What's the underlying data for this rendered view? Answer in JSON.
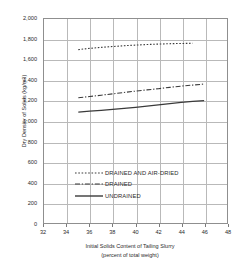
{
  "chart_data": {
    "type": "line",
    "title": "",
    "xlabel": "Initial Solids Content of Tailing Slurry",
    "xlabel_sub": "(percent of total weight)",
    "ylabel": "Dry Density of Solids (kg/m3)",
    "xlim": [
      32,
      48
    ],
    "ylim": [
      0,
      2000
    ],
    "xticks": [
      "32",
      "34",
      "36",
      "38",
      "40",
      "42",
      "44",
      "46",
      "48"
    ],
    "xtick_values": [
      32,
      34,
      36,
      38,
      40,
      42,
      44,
      46,
      48
    ],
    "yticks": [
      "0",
      "200",
      "400",
      "600",
      "800",
      "1,000",
      "1,200",
      "1,400",
      "1,600",
      "1,800",
      "2,000"
    ],
    "ytick_values": [
      0,
      200,
      400,
      600,
      800,
      1000,
      1200,
      1400,
      1600,
      1800,
      2000
    ],
    "grid": true,
    "legend_position": "center-lower",
    "series": [
      {
        "name": "DRAINED AND AIR-DRIED",
        "style": "dotted",
        "x": [
          35.0,
          36.0,
          37.0,
          38.0,
          39.0,
          40.0,
          41.0,
          42.0,
          43.0,
          44.0,
          45.0
        ],
        "values": [
          1700,
          1712,
          1722,
          1730,
          1738,
          1744,
          1750,
          1754,
          1758,
          1760,
          1762
        ]
      },
      {
        "name": "DRAINED",
        "style": "dash-dot",
        "x": [
          35.0,
          36.0,
          37.0,
          38.0,
          39.0,
          40.0,
          41.0,
          42.0,
          43.0,
          44.0,
          45.0,
          46.0
        ],
        "values": [
          1228,
          1240,
          1253,
          1266,
          1280,
          1293,
          1305,
          1317,
          1330,
          1342,
          1352,
          1362
        ]
      },
      {
        "name": "UNDRAINED",
        "style": "solid",
        "x": [
          35.0,
          36.0,
          37.0,
          38.0,
          39.0,
          40.0,
          41.0,
          42.0,
          43.0,
          44.0,
          45.0,
          46.0
        ],
        "values": [
          1088,
          1096,
          1105,
          1114,
          1124,
          1134,
          1146,
          1158,
          1170,
          1182,
          1192,
          1200
        ]
      }
    ]
  },
  "legend": {
    "items": [
      {
        "label": "DRAINED AND AIR-DRIED"
      },
      {
        "label": "DRAINED"
      },
      {
        "label": "UNDRAINED"
      }
    ]
  },
  "colors": {
    "line": "#3a3a3a",
    "grid": "#b9b9b9",
    "frame": "#8f8f8f",
    "text": "#2b2b2b"
  }
}
